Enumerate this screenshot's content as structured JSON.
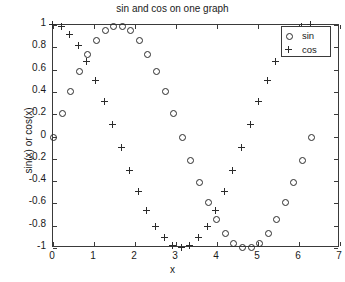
{
  "chart_data": {
    "type": "scatter",
    "title": "sin and cos on one graph",
    "xlabel": "x",
    "ylabel": "sin(x) or cos(x)",
    "xlim": [
      0,
      7
    ],
    "ylim": [
      -1,
      1
    ],
    "xticks": [
      0,
      1,
      2,
      3,
      4,
      5,
      6,
      7
    ],
    "yticks": [
      -1,
      -0.8,
      -0.6,
      -0.4,
      -0.2,
      0,
      0.2,
      0.4,
      0.6,
      0.8,
      1
    ],
    "xticklabels": [
      "0",
      "1",
      "2",
      "3",
      "4",
      "5",
      "6",
      "7"
    ],
    "yticklabels": [
      "-1",
      "-0.8",
      "-0.6",
      "-0.4",
      "-0.2",
      "0",
      "0.2",
      "0.4",
      "0.6",
      "0.8",
      "1"
    ],
    "grid": false,
    "legend_position": "upper right",
    "marker_color": "#2b2b2b",
    "axis_color": "#3a3a3a",
    "x": [
      0,
      0.2094,
      0.4189,
      0.6283,
      0.8378,
      1.0472,
      1.2566,
      1.4661,
      1.6755,
      1.885,
      2.0944,
      2.3038,
      2.5133,
      2.7227,
      2.9322,
      3.1416,
      3.351,
      3.5605,
      3.7699,
      3.9794,
      4.1888,
      4.3982,
      4.6077,
      4.8171,
      5.0265,
      5.236,
      5.4454,
      5.6549,
      5.8643,
      6.0737,
      6.2832
    ],
    "series": [
      {
        "name": "sin",
        "marker": "o",
        "values": [
          0,
          0.2079,
          0.4067,
          0.5878,
          0.743,
          0.866,
          0.9511,
          0.9945,
          0.9945,
          0.9511,
          0.866,
          0.743,
          0.5878,
          0.4067,
          0.2079,
          0,
          -0.2079,
          -0.4067,
          -0.5878,
          -0.743,
          -0.866,
          -0.9511,
          -0.9945,
          -0.9945,
          -0.9511,
          -0.866,
          -0.743,
          -0.5878,
          -0.4067,
          -0.2079,
          0
        ]
      },
      {
        "name": "cos",
        "marker": "+",
        "values": [
          1,
          0.9781,
          0.9135,
          0.809,
          0.6691,
          0.5,
          0.309,
          0.1045,
          -0.1045,
          -0.309,
          -0.5,
          -0.6691,
          -0.809,
          -0.9135,
          -0.9781,
          -1,
          -0.9781,
          -0.9135,
          -0.809,
          -0.6691,
          -0.5,
          -0.309,
          -0.1045,
          0.1045,
          0.309,
          0.5,
          0.6691,
          0.809,
          0.9135,
          0.9781,
          1
        ]
      }
    ]
  },
  "legend": {
    "entries": [
      {
        "label": "sin",
        "marker": "circle-marker-icon"
      },
      {
        "label": "cos",
        "marker": "plus-marker-icon"
      }
    ]
  }
}
